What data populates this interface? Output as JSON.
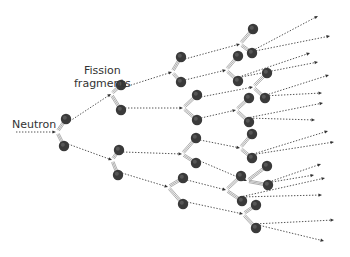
{
  "diagram": {
    "labels": {
      "neutron": "Neutron",
      "fission_line1": "Fission",
      "fission_line2": "fragments"
    },
    "colors": {
      "fragment_fill": "#3a3a3a",
      "fragment_highlight": "#6a6a6a",
      "arrow": "#555555",
      "tail": "#999999"
    },
    "incoming_neutron": {
      "from": [
        16,
        132
      ],
      "to": [
        56,
        132
      ]
    },
    "nodes": [
      {
        "id": "N0",
        "split": [
          57,
          132
        ],
        "top": [
          66,
          119
        ],
        "bottom": [
          64,
          146
        ],
        "children": [
          "A",
          "B"
        ]
      },
      {
        "id": "A",
        "split": [
          111,
          94
        ],
        "top": [
          121,
          85
        ],
        "bottom": [
          121,
          110
        ],
        "children": [
          "C",
          "D"
        ]
      },
      {
        "id": "B",
        "split": [
          112,
          160
        ],
        "top": [
          119,
          150
        ],
        "bottom": [
          118,
          175
        ],
        "children": [
          "G",
          "H"
        ]
      },
      {
        "id": "C",
        "split": [
          172,
          72
        ],
        "top": [
          181,
          57
        ],
        "bottom": [
          181,
          82
        ],
        "children": [
          "E",
          "F"
        ]
      },
      {
        "id": "D",
        "split": [
          183,
          108
        ],
        "top": [
          197,
          95
        ],
        "bottom": [
          197,
          120
        ],
        "children": [
          "I",
          "J"
        ]
      },
      {
        "id": "G",
        "split": [
          182,
          154
        ],
        "top": [
          196,
          138
        ],
        "bottom": [
          196,
          163
        ],
        "children": [
          "K",
          "L"
        ]
      },
      {
        "id": "H",
        "split": [
          168,
          187
        ],
        "top": [
          183,
          178
        ],
        "bottom": [
          183,
          204
        ],
        "children": [
          "M",
          "N"
        ]
      },
      {
        "id": "E",
        "split": [
          240,
          44
        ],
        "top": [
          253,
          29
        ],
        "bottom": [
          252,
          53
        ],
        "children": []
      },
      {
        "id": "F",
        "split": [
          226,
          70
        ],
        "top": [
          238,
          56
        ],
        "bottom": [
          238,
          81
        ],
        "children": []
      },
      {
        "id": "I",
        "split": [
          253,
          87
        ],
        "top": [
          267,
          73
        ],
        "bottom": [
          265,
          98
        ],
        "children": []
      },
      {
        "id": "J",
        "split": [
          236,
          110
        ],
        "top": [
          249,
          98
        ],
        "bottom": [
          249,
          122
        ],
        "children": []
      },
      {
        "id": "K",
        "split": [
          240,
          148
        ],
        "top": [
          252,
          134
        ],
        "bottom": [
          252,
          158
        ],
        "children": []
      },
      {
        "id": "L",
        "split": [
          247,
          181
        ],
        "top": [
          267,
          166
        ],
        "bottom": [
          268,
          185
        ],
        "children": []
      },
      {
        "id": "M",
        "split": [
          226,
          190
        ],
        "top": [
          241,
          176
        ],
        "bottom": [
          242,
          201
        ],
        "children": []
      },
      {
        "id": "N",
        "split": [
          243,
          214
        ],
        "top": [
          256,
          205
        ],
        "bottom": [
          256,
          228
        ],
        "children": []
      }
    ],
    "outgoing_arrows": [
      {
        "from": [
          250,
          52
        ],
        "to": [
          318,
          16
        ]
      },
      {
        "from": [
          250,
          52
        ],
        "to": [
          330,
          36
        ]
      },
      {
        "from": [
          236,
          78
        ],
        "to": [
          310,
          53
        ]
      },
      {
        "from": [
          236,
          78
        ],
        "to": [
          318,
          62
        ]
      },
      {
        "from": [
          263,
          96
        ],
        "to": [
          329,
          75
        ]
      },
      {
        "from": [
          263,
          96
        ],
        "to": [
          322,
          93
        ]
      },
      {
        "from": [
          247,
          118
        ],
        "to": [
          323,
          103
        ]
      },
      {
        "from": [
          247,
          118
        ],
        "to": [
          315,
          120
        ]
      },
      {
        "from": [
          250,
          155
        ],
        "to": [
          328,
          131
        ]
      },
      {
        "from": [
          250,
          155
        ],
        "to": [
          334,
          142
        ]
      },
      {
        "from": [
          266,
          183
        ],
        "to": [
          321,
          164
        ]
      },
      {
        "from": [
          266,
          183
        ],
        "to": [
          314,
          175
        ]
      },
      {
        "from": [
          240,
          197
        ],
        "to": [
          322,
          195
        ]
      },
      {
        "from": [
          240,
          197
        ],
        "to": [
          325,
          178
        ]
      },
      {
        "from": [
          254,
          224
        ],
        "to": [
          334,
          220
        ]
      },
      {
        "from": [
          254,
          224
        ],
        "to": [
          324,
          241
        ]
      }
    ]
  }
}
